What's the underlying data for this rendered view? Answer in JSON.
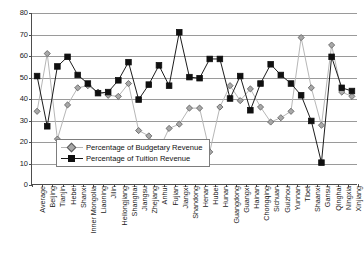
{
  "chart_data": {
    "type": "line",
    "title": "",
    "xlabel": "",
    "ylabel": "",
    "ylim": [
      0,
      80
    ],
    "yticks": [
      0,
      10,
      20,
      30,
      40,
      50,
      60,
      70,
      80
    ],
    "grid": true,
    "legend_position": "inside-lower-left",
    "categories": [
      "Average",
      "Beijing",
      "Tianjin",
      "Hebei",
      "Shanxi",
      "Inner Mongolia",
      "Liaoning",
      "Jilin",
      "Heilongjiang",
      "Shanghai",
      "Jiangsu",
      "Zhejiang",
      "Anhui",
      "Fujian",
      "Jiangxi",
      "Shandong",
      "Henan",
      "Hubei",
      "Hunan",
      "Guangdong",
      "Guangxi",
      "Hainan",
      "Chongqing",
      "Sichuan",
      "Guizhou",
      "Yunnan",
      "Tibet",
      "Shaanxi",
      "Gansu",
      "Qinghai",
      "Ningxia",
      "Xinjiang"
    ],
    "series": [
      {
        "name": "Percentage of Budgetary Revenue",
        "marker": "diamond",
        "color": "#a8a8a8",
        "values": [
          34,
          61,
          21,
          37,
          45,
          46,
          43,
          41.5,
          41,
          47,
          25,
          22.5,
          16,
          26,
          28,
          35.5,
          35.5,
          15,
          36,
          46,
          39,
          44.5,
          36,
          29,
          31,
          34,
          68.5,
          45,
          27.5,
          65,
          43,
          41
        ]
      },
      {
        "name": "Percentage of Tuition Revenue",
        "marker": "square",
        "color": "#101010",
        "values": [
          50.5,
          27,
          55,
          59.5,
          51,
          47,
          42.5,
          43,
          48.5,
          57,
          39.5,
          46.5,
          55.5,
          46,
          71,
          50,
          49.5,
          58.5,
          58.5,
          40,
          50.5,
          34.5,
          47,
          56,
          51,
          47,
          41.5,
          29.5,
          10,
          59.5,
          45,
          43.5
        ]
      }
    ]
  },
  "legend": {
    "items": [
      {
        "label": "Percentage of Budgetary Revenue",
        "marker": "diamond-marker-icon"
      },
      {
        "label": "Percentage of Tuition Revenue",
        "marker": "square-marker-icon"
      }
    ]
  }
}
